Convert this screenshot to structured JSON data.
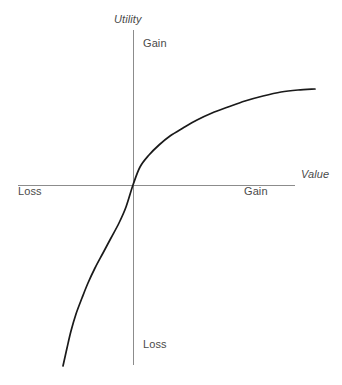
{
  "figure": {
    "background_color": "#ffffff",
    "axis_color": "#8c8c8c",
    "curve_color": "#1a1a1a",
    "text_color": "#4a4a4a"
  },
  "labels": {
    "y_axis_title": "Utility",
    "x_axis_title": "Value",
    "y_positive": "Gain",
    "y_negative": "Loss",
    "x_positive": "Gain",
    "x_negative": "Loss"
  },
  "chart_data": {
    "type": "line",
    "title": "",
    "subtitle": "",
    "xlabel": "Value",
    "ylabel": "Utility",
    "grid": false,
    "legend": null,
    "axes": {
      "origin_px": [
        133,
        185
      ],
      "x_axis_px": {
        "x_start": 18,
        "x_end": 295,
        "y": 185
      },
      "y_axis_px": {
        "y_start": 30,
        "y_end": 365,
        "x": 133
      },
      "x_tick_labels": [
        "Loss",
        "Gain"
      ],
      "y_tick_labels": [
        "Loss",
        "Gain"
      ],
      "xlim": [
        -1.0,
        1.0
      ],
      "ylim": [
        -1.0,
        1.0
      ]
    },
    "annotations": [
      {
        "text": "Utility",
        "position": "y-axis-top",
        "style": "italic"
      },
      {
        "text": "Value",
        "position": "x-axis-right",
        "style": "italic"
      },
      {
        "text": "Gain",
        "position": "y-axis-upper",
        "style": "normal"
      },
      {
        "text": "Loss",
        "position": "y-axis-lower",
        "style": "normal"
      },
      {
        "text": "Gain",
        "position": "x-axis-right-quadrant",
        "style": "normal"
      },
      {
        "text": "Loss",
        "position": "x-axis-left-quadrant",
        "style": "normal"
      }
    ],
    "series": [
      {
        "name": "Prospect theory value function",
        "description": "Concave for gains, steeper and convex for losses, passing through the origin",
        "points_px": [
          [
            63,
            366
          ],
          [
            67,
            348
          ],
          [
            71,
            331
          ],
          [
            76,
            314
          ],
          [
            82,
            298
          ],
          [
            88,
            283
          ],
          [
            95,
            268
          ],
          [
            103,
            253
          ],
          [
            111,
            238
          ],
          [
            119,
            223
          ],
          [
            126,
            207
          ],
          [
            133,
            185
          ],
          [
            140,
            167
          ],
          [
            149,
            155
          ],
          [
            159,
            145
          ],
          [
            170,
            136
          ],
          [
            183,
            128
          ],
          [
            197,
            120
          ],
          [
            212,
            113
          ],
          [
            228,
            107
          ],
          [
            245,
            101
          ],
          [
            263,
            96
          ],
          [
            281,
            92
          ],
          [
            298,
            90
          ],
          [
            315,
            89
          ]
        ],
        "x": [
          -1.0,
          -0.95,
          -0.89,
          -0.82,
          -0.74,
          -0.66,
          -0.57,
          -0.48,
          -0.38,
          -0.28,
          -0.18,
          0.0,
          0.08,
          0.14,
          0.21,
          0.28,
          0.37,
          0.46,
          0.55,
          0.65,
          0.76,
          0.87,
          0.99,
          1.1,
          1.2
        ],
        "y": [
          -1.08,
          -0.98,
          -0.88,
          -0.78,
          -0.68,
          -0.58,
          -0.49,
          -0.4,
          -0.31,
          -0.22,
          -0.13,
          0.0,
          0.11,
          0.18,
          0.24,
          0.29,
          0.34,
          0.39,
          0.43,
          0.46,
          0.5,
          0.53,
          0.55,
          0.57,
          0.58
        ]
      }
    ]
  }
}
